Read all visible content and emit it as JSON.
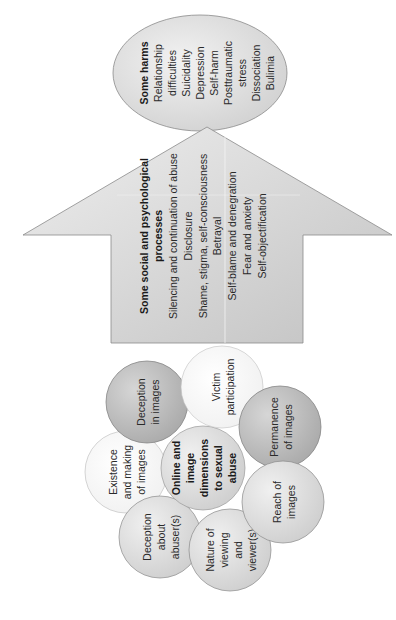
{
  "harms": {
    "title": "Some harms",
    "lines": [
      "Relationship",
      "difficulties",
      "Suicidality",
      "Depression",
      "Self-harm",
      "Posttraumatic",
      "stress",
      "Dissociation",
      "Bulimia"
    ]
  },
  "processes": {
    "title_line1": "Some social and psychological",
    "title_line2": "processes",
    "lines": [
      "Silencing and continuation of abuse",
      "Disclosure",
      "Shame, stigma, self-consciousness",
      "Betrayal",
      "Self-blame and denegration",
      "Fear and anxiety",
      "Self-objectification"
    ]
  },
  "dimensions": {
    "center": [
      "Online and",
      "image",
      "dimensions",
      "to sexual",
      "abuse"
    ],
    "deception_images": [
      "Deception",
      "in images"
    ],
    "victim_participation": [
      "Victim",
      "participation"
    ],
    "existence_making": [
      "Existence",
      "and making",
      "of images"
    ],
    "permanence": [
      "Permanence",
      "of images"
    ],
    "deception_abuser": [
      "Deception",
      "about",
      "abuser(s)"
    ],
    "nature_viewing": [
      "Nature of",
      "viewing",
      "and",
      "viewer(s)"
    ],
    "reach": [
      "Reach of",
      "images"
    ]
  },
  "colors": {
    "stroke": "#8a8a8a",
    "arrow_fill_light": "#e8e8e8",
    "arrow_fill_dark": "#c4c4c4",
    "circle_dark": "#bdbdbd",
    "circle_white": "#ffffff",
    "text": "#2a2a2a"
  }
}
